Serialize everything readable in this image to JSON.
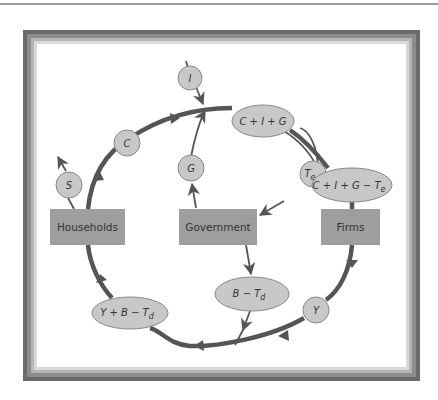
{
  "diagram": {
    "type": "circular-flow",
    "colors": {
      "frame": "#6a6a6a",
      "flow_line": "#555555",
      "box_fill": "#9e9e9e",
      "node_fill": "#c8c8c8",
      "node_stroke": "#888888",
      "text": "#333333"
    },
    "sectors": {
      "households": "Households",
      "government": "Government",
      "firms": "Firms"
    },
    "nodes": {
      "investment": "I",
      "consumption": "C",
      "saving": "S",
      "government_spending": "G",
      "aggregate_demand": "C + I + G",
      "firm_receipts": "C + I + G − T",
      "firm_receipts_sub": "e",
      "excise_tax": "T",
      "excise_tax_sub": "e",
      "income": "Y",
      "transfers_net": "B − T",
      "transfers_net_sub": "d",
      "disposable_income": "Y + B − T",
      "disposable_income_sub": "d"
    }
  }
}
